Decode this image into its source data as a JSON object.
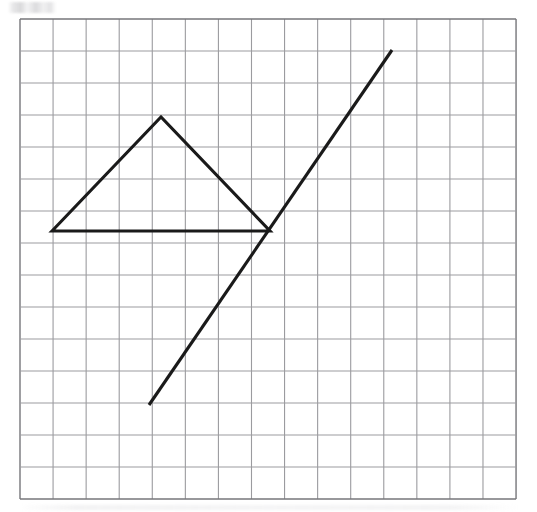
{
  "figure": {
    "title": "Geometric figure drawn on graph paper",
    "background_color": "#ffffff",
    "canvas": {
      "width": 537,
      "height": 512
    }
  },
  "grid": {
    "name": "graph-paper-grid",
    "columns": 15,
    "rows": 15,
    "origin_x": 20,
    "origin_y": 19,
    "cell_width": 33.07,
    "cell_height": 32.0,
    "line_color": "#9b9b9f",
    "line_width": 1.1,
    "border_color": "#76767a",
    "border_width": 1.4
  },
  "shapes": [
    {
      "name": "triangle",
      "type": "polygon",
      "stroke_color": "#1a1a1a",
      "stroke_width": 3.1,
      "fill": "none",
      "closed": true,
      "label": "Triangle",
      "points": [
        {
          "name": "left-vertex",
          "x": 52,
          "y": 231,
          "grid_x": 1,
          "grid_y": 6.63
        },
        {
          "name": "apex-vertex",
          "x": 161,
          "y": 117,
          "grid_x": 4.26,
          "grid_y": 3.06
        },
        {
          "name": "right-vertex",
          "x": 270,
          "y": 231,
          "grid_x": 7.56,
          "grid_y": 6.63
        }
      ]
    },
    {
      "name": "diagonal-line",
      "type": "line",
      "stroke_color": "#1a1a1a",
      "stroke_width": 3.1,
      "fill": "none",
      "closed": false,
      "label": "Diagonal line segment",
      "points": [
        {
          "name": "line-start-point",
          "x": 149,
          "y": 405,
          "grid_x": 3.9,
          "grid_y": 12.06
        },
        {
          "name": "line-end-point",
          "x": 392,
          "y": 50,
          "grid_x": 11.25,
          "grid_y": 0.97
        }
      ]
    }
  ],
  "chart_data": {
    "type": "scatter",
    "title": "Geometric figure drawn on graph paper",
    "xlabel": "",
    "ylabel": "",
    "grid": true,
    "xlim": [
      0,
      15
    ],
    "ylim": [
      0,
      15
    ],
    "series": [
      {
        "name": "Triangle",
        "x": [
          1.0,
          4.26,
          7.56,
          1.0
        ],
        "y": [
          8.37,
          11.94,
          8.37,
          8.37
        ]
      },
      {
        "name": "Diagonal line",
        "x": [
          3.9,
          11.25
        ],
        "y": [
          2.94,
          14.03
        ]
      }
    ]
  }
}
